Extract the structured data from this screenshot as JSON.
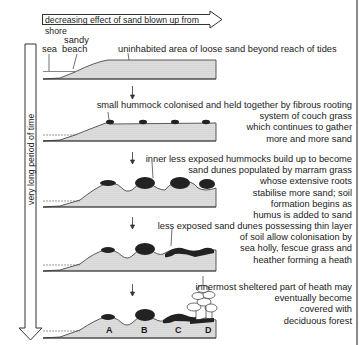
{
  "diagram": {
    "title_arrow": "decreasing effect of sand blown up from shore",
    "time_axis": "very long period of time",
    "stage1": {
      "labels": {
        "sea": "sea",
        "sandy": "sandy",
        "beach": "beach"
      },
      "description": "uninhabited area of loose sand beyond reach of tides"
    },
    "stage2": {
      "description_lines": [
        "small hummock colonised and held together by fibrous rooting",
        "system of couch grass",
        "which continues to gather",
        "more and more sand"
      ]
    },
    "stage3": {
      "description_lines": [
        "inner less exposed hummocks build up to become",
        "sand dunes populated by marram grass",
        "whose extensive roots",
        "stabilise more sand; soil",
        "formation begins as",
        "humus is added to sand"
      ]
    },
    "stage4": {
      "description_lines": [
        "less exposed sand dunes possessing thin layer",
        "of soil allow colonisation by",
        "sea holly, fescue grass and",
        "heather forming a heath"
      ]
    },
    "stage5": {
      "description_lines": [
        "innermost sheltered part of heath may",
        "eventually become",
        "covered with",
        "deciduous forest"
      ],
      "zone_labels": [
        "A",
        "B",
        "C",
        "D"
      ]
    },
    "colors": {
      "line": "#333333",
      "sand_fill": "#d9d9d9",
      "vegetation": "#1a1a1a",
      "edge_rule": "#8a8a8a"
    }
  }
}
